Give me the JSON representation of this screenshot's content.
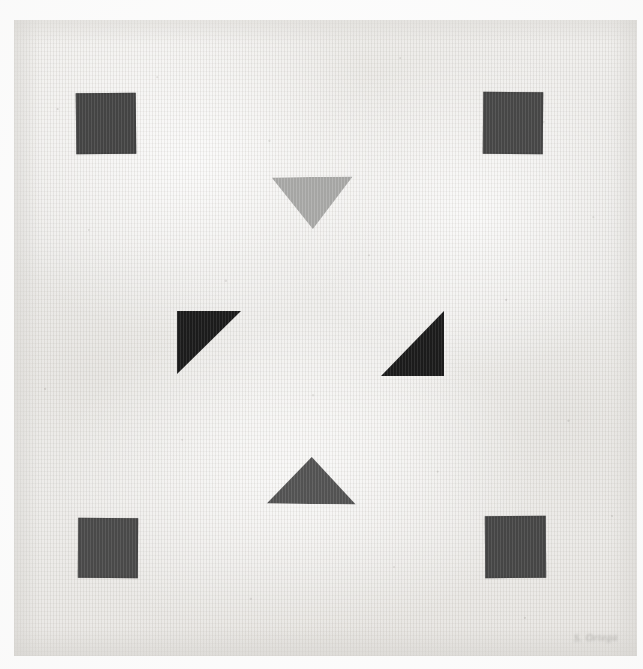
{
  "artwork": {
    "title": "Untitled geometric composition",
    "medium_surface": "textured laid paper",
    "signature_text": "S. Ortega",
    "canvas": {
      "width": 643,
      "height": 669
    },
    "paper": {
      "left": 14,
      "top": 20,
      "width": 623,
      "height": 636,
      "color": "#f0efed",
      "highlight_color": "#f7f6f4",
      "shadow_color": "#e3e1dd"
    },
    "palette": {
      "background_white": "#ffffff",
      "paper_base": "#f0efed",
      "square_charcoal": "#3a3a3a",
      "triangle_black": "#0d0d0d",
      "triangle_light_gray": "#a9a9a7",
      "triangle_dark_gray": "#4b4b4b",
      "signature_gray": "#7a7874"
    },
    "shapes": [
      {
        "id": "square-top-left",
        "name": "square-top-left",
        "type": "square",
        "fill": "#3a3a3a",
        "x": 76,
        "y": 93,
        "width": 60,
        "height": 61,
        "rotation": -0.6
      },
      {
        "id": "square-top-right",
        "name": "square-top-right",
        "type": "square",
        "fill": "#3d3d3d",
        "x": 483,
        "y": 92,
        "width": 60,
        "height": 62,
        "rotation": 0.5
      },
      {
        "id": "square-bottom-left",
        "name": "square-bottom-left",
        "type": "square",
        "fill": "#404040",
        "x": 78,
        "y": 518,
        "width": 60,
        "height": 60,
        "rotation": 0.4
      },
      {
        "id": "square-bottom-right",
        "name": "square-bottom-right",
        "type": "square",
        "fill": "#3c3c3c",
        "x": 485,
        "y": 516,
        "width": 61,
        "height": 62,
        "rotation": -0.4
      },
      {
        "id": "triangle-top-down",
        "name": "triangle-top-pointing-down",
        "type": "triangle",
        "direction": "down",
        "fill": "#a9a9a7",
        "x": 272,
        "y": 177,
        "width": 81,
        "height": 52,
        "rotation": -0.8
      },
      {
        "id": "triangle-left-black",
        "name": "triangle-left-right-angle-top-left",
        "type": "right-triangle",
        "direction": "corner-top-left",
        "fill": "#0d0d0d",
        "x": 177,
        "y": 311,
        "width": 64,
        "height": 63,
        "rotation": 0
      },
      {
        "id": "triangle-right-black",
        "name": "triangle-right-right-angle-bottom-right",
        "type": "right-triangle",
        "direction": "corner-bottom-right",
        "fill": "#0d0d0d",
        "x": 381,
        "y": 311,
        "width": 63,
        "height": 65,
        "rotation": 0
      },
      {
        "id": "triangle-bottom-up",
        "name": "triangle-bottom-pointing-up",
        "type": "triangle",
        "direction": "up",
        "fill": "#4b4b4b",
        "x": 267,
        "y": 457,
        "width": 89,
        "height": 47,
        "rotation": 0.6
      }
    ],
    "signature": {
      "text": "S. Ortega",
      "x": 574,
      "y": 632,
      "legible": false
    }
  }
}
